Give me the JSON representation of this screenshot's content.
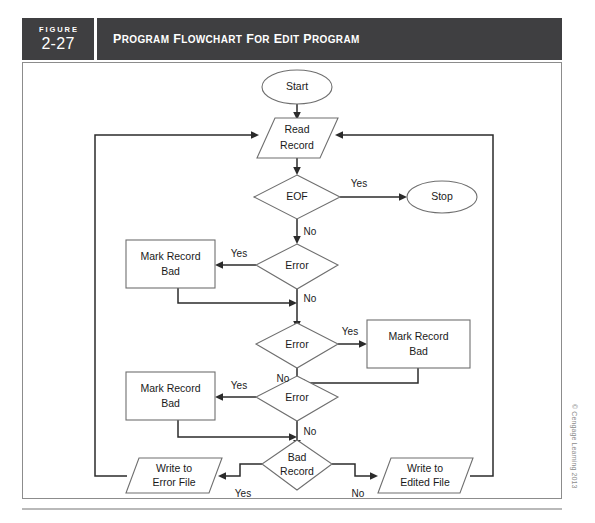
{
  "figure": {
    "label_word": "FIGURE",
    "number": "2-27",
    "title": "Program Flowchart for Edit Program"
  },
  "credit": "© Cengage Learning 2013",
  "chart_data": {
    "type": "diagram",
    "diagram_kind": "flowchart",
    "title": "Program Flowchart for Edit Program",
    "nodes": [
      {
        "id": "start",
        "shape": "terminator",
        "label": "Start",
        "label_line1": "Start",
        "label_line2": ""
      },
      {
        "id": "read",
        "shape": "io",
        "label": "Read Record",
        "label_line1": "Read",
        "label_line2": "Record"
      },
      {
        "id": "eof",
        "shape": "decision",
        "label": "EOF",
        "label_line1": "EOF",
        "label_line2": ""
      },
      {
        "id": "stop",
        "shape": "terminator",
        "label": "Stop",
        "label_line1": "Stop",
        "label_line2": ""
      },
      {
        "id": "error1",
        "shape": "decision",
        "label": "Error",
        "label_line1": "Error",
        "label_line2": ""
      },
      {
        "id": "mark1",
        "shape": "process",
        "label": "Mark Record Bad",
        "label_line1": "Mark Record",
        "label_line2": "Bad"
      },
      {
        "id": "error2",
        "shape": "decision",
        "label": "Error",
        "label_line1": "Error",
        "label_line2": ""
      },
      {
        "id": "mark2",
        "shape": "process",
        "label": "Mark Record Bad",
        "label_line1": "Mark Record",
        "label_line2": "Bad"
      },
      {
        "id": "error3",
        "shape": "decision",
        "label": "Error",
        "label_line1": "Error",
        "label_line2": ""
      },
      {
        "id": "mark3",
        "shape": "process",
        "label": "Mark Record Bad",
        "label_line1": "Mark Record",
        "label_line2": "Bad"
      },
      {
        "id": "badrecord",
        "shape": "decision",
        "label": "Bad Record",
        "label_line1": "Bad",
        "label_line2": "Record"
      },
      {
        "id": "writeerror",
        "shape": "io",
        "label": "Write to Error File",
        "label_line1": "Write to",
        "label_line2": "Error File"
      },
      {
        "id": "writeedited",
        "shape": "io",
        "label": "Write to Edited File",
        "label_line1": "Write to",
        "label_line2": "Edited File"
      }
    ],
    "edges": [
      {
        "from": "start",
        "to": "read",
        "label": ""
      },
      {
        "from": "read",
        "to": "eof",
        "label": ""
      },
      {
        "from": "eof",
        "to": "stop",
        "label": "Yes"
      },
      {
        "from": "eof",
        "to": "error1",
        "label": "No"
      },
      {
        "from": "error1",
        "to": "mark1",
        "label": "Yes"
      },
      {
        "from": "error1",
        "to": "error2",
        "label": "No"
      },
      {
        "from": "mark1",
        "to": "error2",
        "label": ""
      },
      {
        "from": "error2",
        "to": "mark2",
        "label": "Yes"
      },
      {
        "from": "error2",
        "to": "error3",
        "label": "No"
      },
      {
        "from": "mark2",
        "to": "error3",
        "label": ""
      },
      {
        "from": "error3",
        "to": "mark3",
        "label": "Yes"
      },
      {
        "from": "error3",
        "to": "badrecord",
        "label": "No"
      },
      {
        "from": "mark3",
        "to": "badrecord",
        "label": ""
      },
      {
        "from": "badrecord",
        "to": "writeerror",
        "label": "Yes"
      },
      {
        "from": "badrecord",
        "to": "writeedited",
        "label": "No"
      },
      {
        "from": "writeerror",
        "to": "read",
        "label": ""
      },
      {
        "from": "writeedited",
        "to": "read",
        "label": ""
      }
    ],
    "edge_labels": {
      "eof_yes": "Yes",
      "eof_no": "No",
      "error1_yes": "Yes",
      "error1_no": "No",
      "error2_yes": "Yes",
      "error2_no": "No",
      "error3_yes": "Yes",
      "error3_no": "No",
      "badrecord_yes": "Yes",
      "badrecord_no": "No"
    },
    "colors": {
      "header_bg": "#3f3f41",
      "header_text": "#ffffff",
      "shape_stroke": "#6f6f6f",
      "shape_fill": "#ffffff",
      "connector": "#2b2b2b",
      "frame_border": "#8c8c8c",
      "credit_text": "#8d8d8d"
    }
  }
}
